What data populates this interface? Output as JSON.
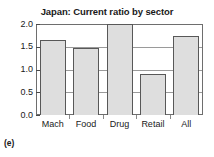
{
  "caption": "(e)",
  "chart_data": {
    "type": "bar",
    "title": "Japan: Current ratio by sector",
    "xlabel": "",
    "ylabel": "",
    "categories": [
      "Mach",
      "Food",
      "Drug",
      "Retail",
      "All"
    ],
    "values": [
      1.65,
      1.47,
      2.0,
      0.9,
      1.73
    ],
    "ylim": [
      0.0,
      2.0
    ],
    "yticks": [
      "0.0",
      "0.5",
      "1.0",
      "1.5",
      "2.0"
    ],
    "ytick_values": [
      0.0,
      0.5,
      1.0,
      1.5,
      2.0
    ],
    "grid": true,
    "legend": false,
    "bar_fill_color": "#dedede",
    "bar_edge_color": "#585858",
    "gridline_color": "#9a9a9a",
    "frame_color": "#6e6e6e",
    "background_color": "#ffffff"
  }
}
